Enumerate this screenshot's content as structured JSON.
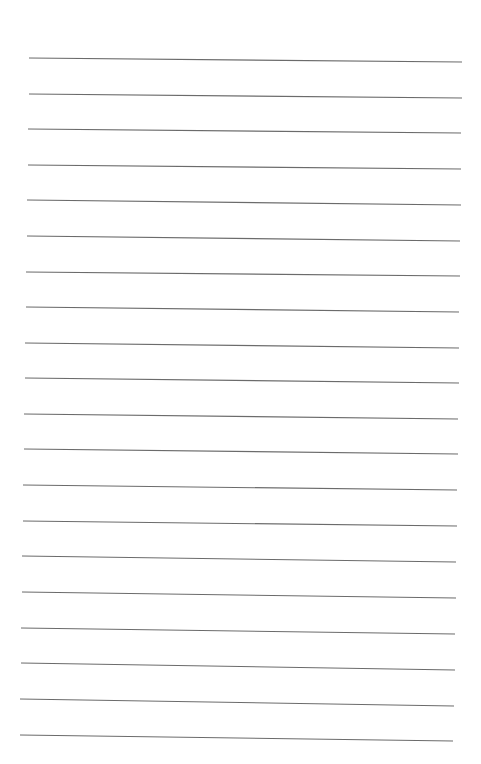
{
  "page": {
    "type": "lined-paper",
    "background_color": "#ffffff",
    "line_color": "#6b6b6b",
    "line_count": 20,
    "lines": [
      {
        "x1": 29,
        "y1": 58,
        "x2": 462,
        "y2": 62
      },
      {
        "x1": 29,
        "y1": 94,
        "x2": 462,
        "y2": 98
      },
      {
        "x1": 28,
        "y1": 129,
        "x2": 461,
        "y2": 133
      },
      {
        "x1": 28,
        "y1": 165,
        "x2": 461,
        "y2": 169
      },
      {
        "x1": 27,
        "y1": 200,
        "x2": 461,
        "y2": 205
      },
      {
        "x1": 27,
        "y1": 236,
        "x2": 460,
        "y2": 241
      },
      {
        "x1": 26,
        "y1": 272,
        "x2": 460,
        "y2": 276
      },
      {
        "x1": 26,
        "y1": 307,
        "x2": 459,
        "y2": 312
      },
      {
        "x1": 25,
        "y1": 343,
        "x2": 459,
        "y2": 348
      },
      {
        "x1": 25,
        "y1": 378,
        "x2": 459,
        "y2": 383
      },
      {
        "x1": 24,
        "y1": 414,
        "x2": 458,
        "y2": 419
      },
      {
        "x1": 24,
        "y1": 449,
        "x2": 458,
        "y2": 454
      },
      {
        "x1": 23,
        "y1": 485,
        "x2": 457,
        "y2": 490
      },
      {
        "x1": 23,
        "y1": 521,
        "x2": 457,
        "y2": 526
      },
      {
        "x1": 22,
        "y1": 556,
        "x2": 456,
        "y2": 562
      },
      {
        "x1": 22,
        "y1": 592,
        "x2": 456,
        "y2": 598
      },
      {
        "x1": 21,
        "y1": 628,
        "x2": 455,
        "y2": 634
      },
      {
        "x1": 21,
        "y1": 663,
        "x2": 455,
        "y2": 670
      },
      {
        "x1": 20,
        "y1": 699,
        "x2": 454,
        "y2": 706
      },
      {
        "x1": 20,
        "y1": 735,
        "x2": 453,
        "y2": 741
      }
    ]
  }
}
